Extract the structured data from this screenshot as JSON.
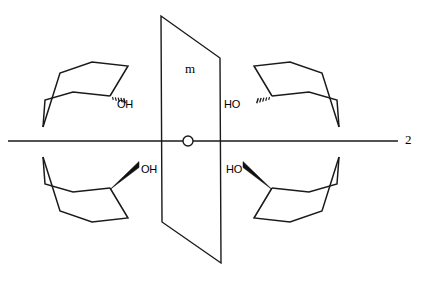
{
  "figure": {
    "background_color": "#ffffff",
    "line_color": "#1a1a1a",
    "width": 425,
    "height": 281
  },
  "symmetry_elements": {
    "mirror_plane": {
      "label": "m",
      "label_x": 185,
      "label_y": 62,
      "description": "vertical mirror plane drawn in perspective as a parallelogram",
      "corners": [
        [
          161,
          16
        ],
        [
          220,
          58
        ],
        [
          221,
          263
        ],
        [
          162,
          222
        ]
      ]
    },
    "rotation_axis": {
      "label": "2",
      "label_x": 405,
      "label_y": 133,
      "description": "horizontal two-fold rotation axis running left to right",
      "line_start_x": 8,
      "line_end_x": 398,
      "line_y": 141
    },
    "axis_marker": {
      "icon": "circle-icon",
      "cx": 188,
      "cy": 141,
      "r": 5,
      "description": "open circle marking the intersection of the rotation axis with the mirror plane"
    }
  },
  "structures": [
    {
      "id": "top-left",
      "position": "upper left quadrant",
      "molecule": "cyclohexanol chair",
      "substituent_label": "OH",
      "label_x": 117,
      "label_y": 99,
      "bond_type": "hashed-wedge",
      "bond_description": "dashed/hashed bond indicating substituent pointing back",
      "ring_points": "43,127 45,100 73,92 110,96 128,66 92,62 60,73 43,127",
      "ring_path": "M 43,127 L 45,100 L 73,92 L 110,96 M 110,96 L 128,66 L 92,62 L 60,73 L 43,127",
      "attach_x": 110,
      "attach_y": 98
    },
    {
      "id": "top-right",
      "position": "upper right quadrant",
      "molecule": "cyclohexanol chair",
      "substituent_label": "HO",
      "label_x": 224,
      "label_y": 99,
      "bond_type": "hashed-wedge",
      "bond_description": "dashed/hashed bond indicating substituent pointing back",
      "ring_path": "M 339,127 L 337,100 L 309,92 L 272,96 M 272,96 L 254,66 L 290,62 L 322,73 L 339,127",
      "attach_x": 272,
      "attach_y": 98
    },
    {
      "id": "bottom-left",
      "position": "lower left quadrant",
      "molecule": "cyclohexanol chair",
      "substituent_label": "OH",
      "label_x": 141,
      "label_y": 164,
      "bond_type": "solid-wedge",
      "bond_description": "bold solid wedge indicating substituent pointing forward",
      "ring_path": "M 43,157 L 45,184 L 73,192 L 110,188 M 110,188 L 128,218 L 92,222 L 60,211 L 43,157",
      "attach_x": 110,
      "attach_y": 186
    },
    {
      "id": "bottom-right",
      "position": "lower right quadrant",
      "molecule": "cyclohexanol chair",
      "substituent_label": "HO",
      "label_x": 226,
      "label_y": 164,
      "bond_type": "solid-wedge",
      "bond_description": "bold solid wedge indicating substituent pointing forward",
      "ring_path": "M 339,157 L 337,184 L 309,192 L 272,188 M 272,188 L 254,218 L 290,222 L 322,211 L 339,157",
      "attach_x": 272,
      "attach_y": 186
    }
  ]
}
